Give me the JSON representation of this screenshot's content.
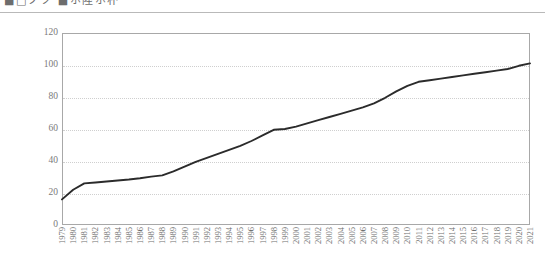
{
  "header": {
    "title": "■□ノツ ■ホ陸ホ朴",
    "rule": true
  },
  "chart_data": {
    "type": "line",
    "title": "",
    "xlabel": "",
    "ylabel": "",
    "ylim": [
      0,
      120
    ],
    "yticks": [
      0,
      20,
      40,
      60,
      80,
      100,
      120
    ],
    "grid": true,
    "legend": false,
    "line_color": "#2b2b2b",
    "categories": [
      "1979",
      "1980",
      "1981",
      "1982",
      "1983",
      "1984",
      "1985",
      "1986",
      "1987",
      "1988",
      "1989",
      "1990",
      "1991",
      "1992",
      "1993",
      "1994",
      "1995",
      "1996",
      "1997",
      "1998",
      "1999",
      "2000",
      "2001",
      "2002",
      "2003",
      "2004",
      "2005",
      "2006",
      "2007",
      "2008",
      "2009",
      "2010",
      "2011",
      "2012",
      "2013",
      "2014",
      "2015",
      "2016",
      "2017",
      "2018",
      "2019",
      "2020",
      "2021"
    ],
    "values": [
      16.0,
      22.0,
      26.0,
      26.6,
      27.2,
      27.8,
      28.4,
      29.2,
      30.2,
      31.0,
      33.5,
      36.5,
      39.5,
      42.0,
      44.5,
      47.0,
      49.5,
      52.5,
      56.0,
      59.5,
      60.0,
      61.5,
      63.5,
      65.5,
      67.5,
      69.5,
      71.5,
      73.5,
      76.0,
      79.5,
      83.5,
      87.0,
      89.5,
      90.5,
      91.5,
      92.5,
      93.5,
      94.5,
      95.5,
      96.5,
      97.5,
      99.5,
      101.0
    ]
  }
}
